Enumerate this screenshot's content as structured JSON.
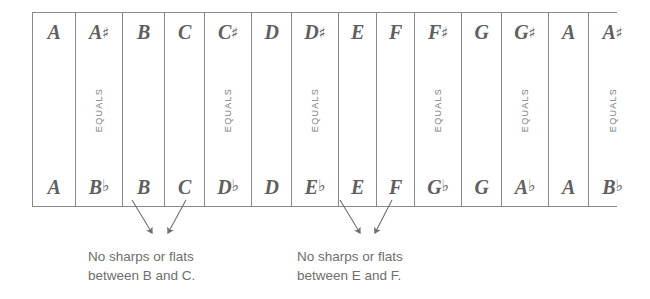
{
  "diagram": {
    "equals_label": "EQUALS",
    "line_color": "#8a8a8a",
    "text_color": "#6b6b6b"
  },
  "chart_data": {
    "type": "table",
    "columns": [
      {
        "sharp": "A",
        "sharp_accidental": "",
        "flat": "A",
        "flat_accidental": "",
        "equals": false,
        "width": 43
      },
      {
        "sharp": "A",
        "sharp_accidental": "♯",
        "flat": "B",
        "flat_accidental": "♭",
        "equals": true,
        "width": 47
      },
      {
        "sharp": "B",
        "sharp_accidental": "",
        "flat": "B",
        "flat_accidental": "",
        "equals": false,
        "width": 42
      },
      {
        "sharp": "C",
        "sharp_accidental": "",
        "flat": "C",
        "flat_accidental": "",
        "equals": false,
        "width": 40
      },
      {
        "sharp": "C",
        "sharp_accidental": "♯",
        "flat": "D",
        "flat_accidental": "♭",
        "equals": true,
        "width": 47
      },
      {
        "sharp": "D",
        "sharp_accidental": "",
        "flat": "D",
        "flat_accidental": "",
        "equals": false,
        "width": 40
      },
      {
        "sharp": "D",
        "sharp_accidental": "♯",
        "flat": "E",
        "flat_accidental": "♭",
        "equals": true,
        "width": 47
      },
      {
        "sharp": "E",
        "sharp_accidental": "",
        "flat": "E",
        "flat_accidental": "",
        "equals": false,
        "width": 38
      },
      {
        "sharp": "F",
        "sharp_accidental": "",
        "flat": "F",
        "flat_accidental": "",
        "equals": false,
        "width": 38
      },
      {
        "sharp": "F",
        "sharp_accidental": "♯",
        "flat": "G",
        "flat_accidental": "♭",
        "equals": true,
        "width": 47
      },
      {
        "sharp": "G",
        "sharp_accidental": "",
        "flat": "G",
        "flat_accidental": "",
        "equals": false,
        "width": 40
      },
      {
        "sharp": "G",
        "sharp_accidental": "♯",
        "flat": "A",
        "flat_accidental": "♭",
        "equals": true,
        "width": 47
      },
      {
        "sharp": "A",
        "sharp_accidental": "",
        "flat": "A",
        "flat_accidental": "",
        "equals": false,
        "width": 40
      },
      {
        "sharp": "A",
        "sharp_accidental": "♯",
        "flat": "B",
        "flat_accidental": "♭",
        "equals": true,
        "width": 47
      }
    ],
    "row_headers": [
      "sharp names",
      "flat names"
    ],
    "annotations": [
      {
        "id": "bc",
        "lines": [
          "No sharps or flats",
          "between B and C."
        ],
        "points_to": [
          "B",
          "C"
        ]
      },
      {
        "id": "ef",
        "lines": [
          "No sharps or flats",
          "between E and F."
        ],
        "points_to": [
          "E",
          "F"
        ]
      }
    ]
  },
  "captions": {
    "bc": {
      "line1": "No sharps or flats",
      "line2": "between B and C."
    },
    "ef": {
      "line1": "No sharps or flats",
      "line2": "between E and F."
    }
  }
}
